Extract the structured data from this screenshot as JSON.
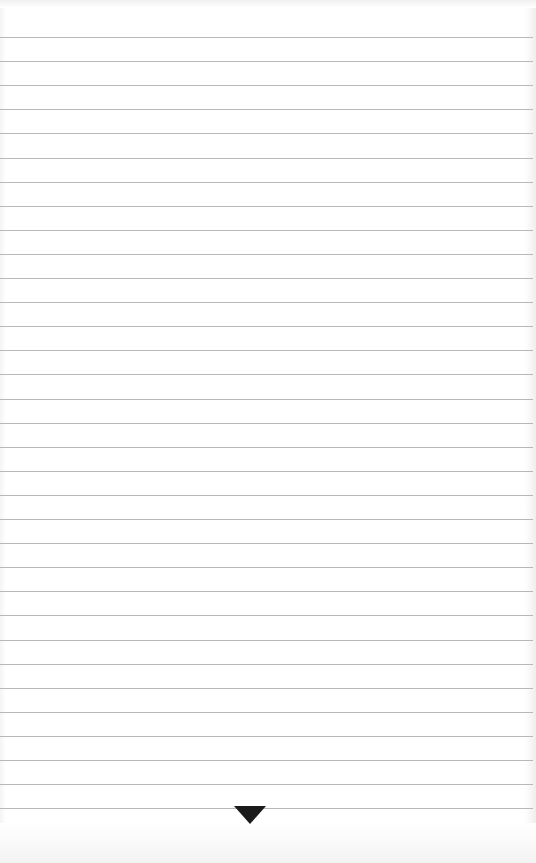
{
  "paper": {
    "background": "#ffffff",
    "rule_color": "#b8b8b8",
    "rule_count": 33,
    "first_rule_y": 37,
    "rule_spacing": 24.1
  },
  "marker": {
    "icon": "triangle-down-icon",
    "color": "#1a1a1a"
  }
}
